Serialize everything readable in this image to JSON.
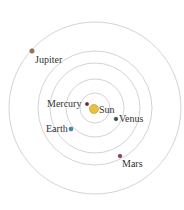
{
  "diagram": {
    "center": {
      "x": 95,
      "y": 108
    },
    "orbit_color": "#c8c8c8",
    "orbits": [
      {
        "name": "orbit-1",
        "r": 15
      },
      {
        "name": "orbit-2",
        "r": 29
      },
      {
        "name": "orbit-3",
        "r": 45
      },
      {
        "name": "orbit-4",
        "r": 57
      },
      {
        "name": "orbit-5",
        "r": 86
      }
    ],
    "bodies": [
      {
        "name": "Sun",
        "x": 94,
        "y": 109,
        "r": 4.5,
        "color": "#e8c23a",
        "stroke": "#b8922a",
        "label_x": 99,
        "label_y": 105
      },
      {
        "name": "Mercury",
        "x": 87,
        "y": 104,
        "r": 1.6,
        "color": "#7a2a2a",
        "stroke": "#5a1a1a",
        "label_x": 47,
        "label_y": 99
      },
      {
        "name": "Venus",
        "x": 116,
        "y": 119,
        "r": 1.8,
        "color": "#2f5a4a",
        "stroke": "#1f3a2f",
        "label_x": 119,
        "label_y": 114
      },
      {
        "name": "Earth",
        "x": 71,
        "y": 129,
        "r": 2.0,
        "color": "#3f8fb4",
        "stroke": "#2a6a8a",
        "label_x": 46,
        "label_y": 124
      },
      {
        "name": "Mars",
        "x": 120,
        "y": 156,
        "r": 1.8,
        "color": "#9a3a4a",
        "stroke": "#6a2a3a",
        "label_x": 122,
        "label_y": 159
      },
      {
        "name": "Jupiter",
        "x": 32,
        "y": 51,
        "r": 2.2,
        "color": "#a8725a",
        "stroke": "#7a5040",
        "label_x": 35,
        "label_y": 55
      }
    ]
  },
  "labels": {
    "sun": "Sun",
    "mercury": "Mercury",
    "venus": "Venus",
    "earth": "Earth",
    "mars": "Mars",
    "jupiter": "Jupiter"
  }
}
